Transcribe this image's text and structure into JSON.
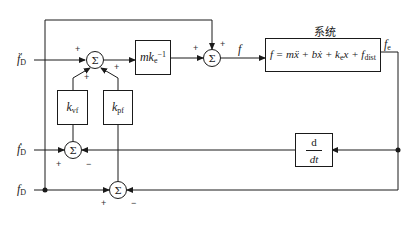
{
  "diagram": {
    "type": "block-diagram",
    "title": "系统",
    "inputs": [
      {
        "id": "fD_ddot",
        "label": "f̈",
        "sub": "D"
      },
      {
        "id": "fD_dot",
        "label": "ḟ",
        "sub": "D"
      },
      {
        "id": "fD",
        "label": "f",
        "sub": "D"
      }
    ],
    "blocks": {
      "mke_inv": {
        "main": "mk",
        "sub": "e",
        "sup": "−1"
      },
      "kvf": {
        "main": "k",
        "sub": "vf"
      },
      "kpf": {
        "main": "k",
        "sub": "pf"
      },
      "ddt": {
        "num": "d",
        "den": "dt"
      },
      "system": {
        "equation_lhs": "f = mẍ + bẋ + k",
        "equation_sub": "e",
        "equation_mid": "x + f",
        "equation_sub2": "dist"
      }
    },
    "summers": {
      "sum1": {
        "symbol": "Σ",
        "signs": [
          "+",
          "+",
          "+"
        ]
      },
      "sum2": {
        "symbol": "Σ",
        "signs": [
          "+",
          "+"
        ]
      },
      "sum3": {
        "symbol": "Σ",
        "signs": [
          "+",
          "−"
        ]
      },
      "sum4": {
        "symbol": "Σ",
        "signs": [
          "+",
          "−"
        ]
      }
    },
    "signals": {
      "f": "f",
      "fe": "f",
      "fe_sub": "e"
    }
  }
}
